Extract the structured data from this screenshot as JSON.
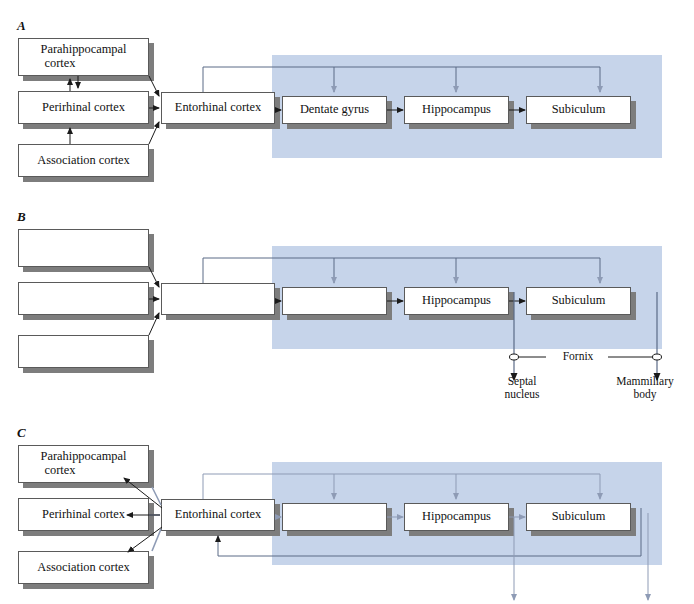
{
  "figure": {
    "type": "diagram",
    "panels": [
      {
        "id": "A",
        "label": "A",
        "boxes": [
          {
            "name": "parahippocampal-cortex",
            "label": "Parahippocampal\ncortex",
            "visible_text": true
          },
          {
            "name": "perirhinal-cortex",
            "label": "Perirhinal cortex",
            "visible_text": true
          },
          {
            "name": "association-cortex",
            "label": "Association cortex",
            "visible_text": true
          },
          {
            "name": "entorhinal-cortex",
            "label": "Entorhinal cortex",
            "visible_text": true
          },
          {
            "name": "dentate-gyrus",
            "label": "Dentate gyrus",
            "visible_text": true
          },
          {
            "name": "hippocampus",
            "label": "Hippocampus",
            "visible_text": true
          },
          {
            "name": "subiculum",
            "label": "Subiculum",
            "visible_text": true
          }
        ]
      },
      {
        "id": "B",
        "label": "B",
        "boxes": [
          {
            "name": "parahippocampal-cortex",
            "label": "",
            "visible_text": false
          },
          {
            "name": "perirhinal-cortex",
            "label": "",
            "visible_text": false
          },
          {
            "name": "association-cortex",
            "label": "",
            "visible_text": false
          },
          {
            "name": "entorhinal-cortex",
            "label": "",
            "visible_text": false
          },
          {
            "name": "dentate-gyrus",
            "label": "",
            "visible_text": false
          },
          {
            "name": "hippocampus",
            "label": "Hippocampus",
            "visible_text": true
          },
          {
            "name": "subiculum",
            "label": "Subiculum",
            "visible_text": true
          }
        ],
        "annotations": [
          {
            "name": "fornix-label",
            "label": "Fornix"
          },
          {
            "name": "septal-nucleus-label",
            "label": "Septal\nnucleus"
          },
          {
            "name": "mammillary-body-label",
            "label": "Mammillary\nbody"
          }
        ]
      },
      {
        "id": "C",
        "label": "C",
        "boxes": [
          {
            "name": "parahippocampal-cortex",
            "label": "Parahippocampal\ncortex",
            "visible_text": true
          },
          {
            "name": "perirhinal-cortex",
            "label": "Perirhinal cortex",
            "visible_text": true
          },
          {
            "name": "association-cortex",
            "label": "Association cortex",
            "visible_text": true
          },
          {
            "name": "entorhinal-cortex",
            "label": "Entorhinal cortex",
            "visible_text": true
          },
          {
            "name": "dentate-gyrus",
            "label": "",
            "visible_text": false
          },
          {
            "name": "hippocampus",
            "label": "Hippocampus",
            "visible_text": true
          },
          {
            "name": "subiculum",
            "label": "Subiculum",
            "visible_text": true
          }
        ]
      }
    ],
    "colors": {
      "highlight_band": "#c6d4ea",
      "box_fill": "#ffffff",
      "box_border": "#5a5a5a",
      "box_shadow": "#7d7d7d",
      "arrow_dark": "#1a1a1a",
      "arrow_gray": "#8e9bb5",
      "text": "#111111"
    },
    "text": {
      "parahippocampal_line1": "Parahippocampal",
      "parahippocampal_line2": "cortex",
      "perirhinal": "Perirhinal cortex",
      "association": "Association cortex",
      "entorhinal": "Entorhinal cortex",
      "dentate": "Dentate gyrus",
      "hippocampus": "Hippocampus",
      "subiculum": "Subiculum",
      "fornix": "Fornix",
      "septal_line1": "Septal",
      "septal_line2": "nucleus",
      "mammillary_line1": "Mammillary",
      "mammillary_line2": "body",
      "panel_a": "A",
      "panel_b": "B",
      "panel_c": "C"
    }
  }
}
